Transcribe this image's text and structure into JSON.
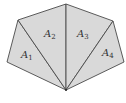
{
  "diagram": {
    "type": "polygon-triangulation",
    "fill_color": "#d9d9d9",
    "stroke_color": "#4a4a4a",
    "regions": [
      {
        "id": "A1",
        "label": "A",
        "subscript": "1"
      },
      {
        "id": "A2",
        "label": "A",
        "subscript": "2"
      },
      {
        "id": "A3",
        "label": "A",
        "subscript": "3"
      },
      {
        "id": "A4",
        "label": "A",
        "subscript": "4"
      }
    ]
  }
}
